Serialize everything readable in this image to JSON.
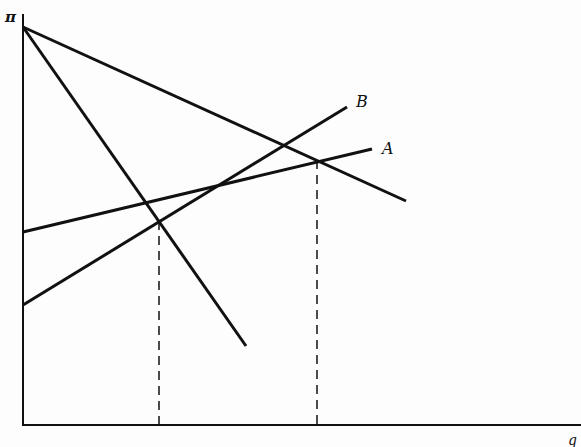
{
  "diagram": {
    "y_axis_label": "π",
    "x_axis_label": "q",
    "curve_labels": {
      "A": "A",
      "B": "B"
    },
    "lines": [
      {
        "name": "steep-decreasing",
        "x1": 23,
        "y1": 27,
        "x2": 246,
        "y2": 346
      },
      {
        "name": "shallow-decreasing",
        "x1": 23,
        "y1": 27,
        "x2": 406,
        "y2": 201
      },
      {
        "name": "A",
        "x1": 23,
        "y1": 232,
        "x2": 372,
        "y2": 149
      },
      {
        "name": "B",
        "x1": 23,
        "y1": 305,
        "x2": 347,
        "y2": 107
      }
    ],
    "dashed_drops": [
      {
        "x": 159,
        "y_top": 221
      },
      {
        "x": 317,
        "y_top": 160
      }
    ]
  }
}
